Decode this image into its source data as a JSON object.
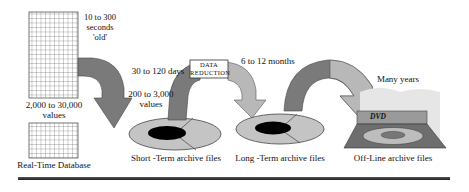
{
  "diagram": {
    "realtime": {
      "age_label": [
        "10 to 300",
        "seconds",
        "'old'"
      ],
      "values_label": [
        "2,000 to 30,000",
        "values"
      ],
      "title": "Real-Time Database"
    },
    "short_term": {
      "duration": "30 to 120 days",
      "values_label": [
        "200 to 3,000",
        "values"
      ],
      "title": "Short -Term archive files"
    },
    "reduction": {
      "box_label": [
        "DATA",
        "REDUCTION"
      ]
    },
    "long_term": {
      "duration": "6 to 12 months",
      "title": "Long -Term archive files"
    },
    "offline": {
      "duration": "Many years",
      "drive_label": "DVD",
      "title": "Off-Line archive files"
    },
    "colors": {
      "dark_arrow": "#7a7a7a",
      "light_arrow": "#b8b8b8",
      "disk": "#c4c4c4",
      "disk_hole": "#000000",
      "grid": "#555555"
    }
  }
}
